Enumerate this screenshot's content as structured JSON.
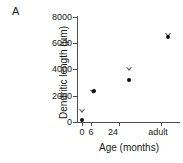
{
  "figure": {
    "panel_label": "A",
    "background_color": "#ffffff",
    "marker_color_circle": "#111111",
    "marker_color_triangle": "#555555",
    "axis_color": "#4d4d4d"
  },
  "chart_data": {
    "type": "scatter",
    "title": "",
    "xlabel": "Age (months)",
    "ylabel": "Dendritic length (µm)",
    "categories": [
      "0",
      "6",
      "24",
      "adult"
    ],
    "x_positions": [
      0,
      6,
      24,
      44
    ],
    "xlim": [
      -2,
      50
    ],
    "ylim": [
      0,
      8000
    ],
    "yticks": [
      0,
      2000,
      4000,
      6000,
      8000
    ],
    "ytick_labels": [
      "0",
      "2000",
      "4000",
      "6000",
      "8000"
    ],
    "xtick_labels": [
      "0",
      "6",
      "24",
      "adult"
    ],
    "grid": false,
    "legend": null,
    "series": [
      {
        "name": "open-triangle",
        "marker": "triangle-down-open",
        "values": [
          800,
          2550,
          4600,
          7500
        ]
      },
      {
        "name": "filled-circle",
        "marker": "circle-filled",
        "values": [
          150,
          2400,
          3200,
          6500
        ]
      }
    ]
  }
}
